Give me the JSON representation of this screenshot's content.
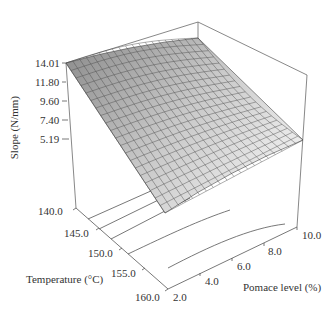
{
  "chart_data": {
    "type": "surface3d",
    "title": "",
    "zlabel": "Slope (N/mm)",
    "xlabel": "Temperature (°C)",
    "ylabel": "Pomace level (%)",
    "z_ticks": [
      "14.01",
      "11.80",
      "9.60",
      "7.40",
      "5.19"
    ],
    "x_ticks": [
      "140.0",
      "145.0",
      "150.0",
      "155.0",
      "160.0"
    ],
    "y_ticks": [
      "2.0",
      "4.0",
      "6.0",
      "8.0",
      "10.0"
    ],
    "zlim": [
      2.98,
      14.01
    ],
    "xlim": [
      140.0,
      160.0
    ],
    "ylim": [
      2.0,
      10.0
    ],
    "corner_values": {
      "T140_P2": 14.01,
      "T140_P10": 12.9,
      "T160_P2": 4.3,
      "T160_P10": 9.0
    },
    "surface_color": "#9a9a9a",
    "grid_lines": "on",
    "contour_projection": "on floor"
  }
}
